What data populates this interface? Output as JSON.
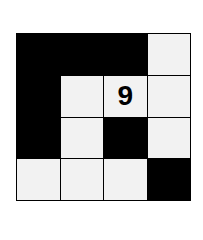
{
  "puzzle": {
    "rows": 4,
    "cols": 4,
    "cells": [
      [
        {
          "color": "black",
          "text": ""
        },
        {
          "color": "black",
          "text": ""
        },
        {
          "color": "black",
          "text": ""
        },
        {
          "color": "white",
          "text": ""
        }
      ],
      [
        {
          "color": "black",
          "text": ""
        },
        {
          "color": "white",
          "text": ""
        },
        {
          "color": "white",
          "text": "9"
        },
        {
          "color": "white",
          "text": ""
        }
      ],
      [
        {
          "color": "black",
          "text": ""
        },
        {
          "color": "white",
          "text": ""
        },
        {
          "color": "black",
          "text": ""
        },
        {
          "color": "white",
          "text": ""
        }
      ],
      [
        {
          "color": "white",
          "text": ""
        },
        {
          "color": "white",
          "text": ""
        },
        {
          "color": "white",
          "text": ""
        },
        {
          "color": "black",
          "text": ""
        }
      ]
    ]
  }
}
